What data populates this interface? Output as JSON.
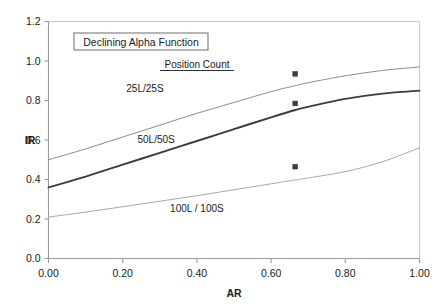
{
  "chart_data": {
    "type": "line",
    "title": "Declining Alpha Function",
    "legend_heading": "Position Count",
    "xlabel": "AR",
    "ylabel": "IR",
    "xlim": [
      0.0,
      1.0
    ],
    "ylim": [
      0.0,
      1.2
    ],
    "xticks": [
      "0.00",
      "0.20",
      "0.40",
      "0.60",
      "0.80",
      "1.00"
    ],
    "xtick_values": [
      0.0,
      0.2,
      0.4,
      0.6,
      0.8,
      1.0
    ],
    "yticks": [
      "0.0",
      "0.2",
      "0.4",
      "0.6",
      "0.8",
      "1.0",
      "1.2"
    ],
    "ytick_values": [
      0.0,
      0.2,
      0.4,
      0.6,
      0.8,
      1.0,
      1.2
    ],
    "grid": false,
    "legend_position": "inline-annotations",
    "x": [
      0.0,
      0.1,
      0.2,
      0.3,
      0.4,
      0.5,
      0.6,
      0.665,
      0.7,
      0.8,
      0.9,
      1.0
    ],
    "series": [
      {
        "name": "25L/25S",
        "color": "#8c8c8c",
        "width": 1,
        "label_x": 0.26,
        "label_y": 0.845,
        "values": [
          0.5,
          0.555,
          0.615,
          0.675,
          0.735,
          0.79,
          0.845,
          0.875,
          0.89,
          0.925,
          0.952,
          0.97
        ],
        "marker": {
          "x": 0.665,
          "y": 0.935,
          "shape": "square"
        }
      },
      {
        "name": "50L/50S",
        "color": "#3c3c3c",
        "width": 1.9,
        "label_x": 0.29,
        "label_y": 0.585,
        "values": [
          0.36,
          0.415,
          0.475,
          0.535,
          0.595,
          0.655,
          0.715,
          0.752,
          0.768,
          0.808,
          0.835,
          0.85
        ],
        "marker": {
          "x": 0.665,
          "y": 0.785,
          "shape": "square"
        }
      },
      {
        "name": "100L / 100S",
        "color": "#a8a8a8",
        "width": 1,
        "label_x": 0.4,
        "label_y": 0.235,
        "values": [
          0.21,
          0.235,
          0.262,
          0.29,
          0.318,
          0.348,
          0.378,
          0.398,
          0.408,
          0.44,
          0.49,
          0.56
        ],
        "marker": {
          "x": 0.665,
          "y": 0.465,
          "shape": "square"
        }
      }
    ]
  },
  "colors": {
    "axis": "#9a9a9a",
    "text": "#1a1a1a",
    "title_border": "#6e6e6e",
    "marker": "#3c3c3c",
    "background": "#ffffff"
  }
}
